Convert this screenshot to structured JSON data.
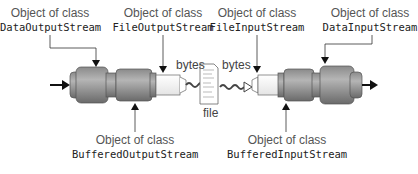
{
  "labels": {
    "data_output": {
      "prefix": "Object of class",
      "cls": "DataOutputStream"
    },
    "file_output": {
      "prefix": "Object of class",
      "cls": "FileOutputStream"
    },
    "file_input": {
      "prefix": "Object of class",
      "cls": "FileInputStream"
    },
    "data_input": {
      "prefix": "Object of class",
      "cls": "DataInputStream"
    },
    "buffered_output": {
      "prefix": "Object of class",
      "cls": "BufferedOutputStream"
    },
    "buffered_input": {
      "prefix": "Object of class",
      "cls": "BufferedInputStream"
    }
  },
  "bytes_left": "bytes",
  "bytes_right": "bytes",
  "file_label": "file",
  "colors": {
    "cylinder": "#9a9a9a",
    "cylinder_dark": "#6e6e6e",
    "line": "#222222"
  }
}
